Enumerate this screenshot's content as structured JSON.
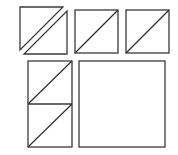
{
  "diagram": {
    "type": "quilt-block-pieces",
    "background": "#ffffff",
    "stroke_color": "#3a3a3a",
    "pieces": [
      {
        "id": "split-square",
        "kind": "two-separated-half-square-triangles",
        "triangles": [
          {
            "points": [
              [
                20,
                7
              ],
              [
                63,
                7
              ],
              [
                20,
                50
              ]
            ]
          },
          {
            "points": [
              [
                67,
                11
              ],
              [
                67,
                54
              ],
              [
                24,
                54
              ]
            ]
          }
        ]
      },
      {
        "id": "hst-square-1",
        "kind": "half-square-triangle",
        "rect": {
          "x": 75,
          "y": 10,
          "w": 43,
          "h": 43
        },
        "diagonal": [
          [
            75,
            53
          ],
          [
            118,
            10
          ]
        ]
      },
      {
        "id": "hst-square-2",
        "kind": "half-square-triangle",
        "rect": {
          "x": 126,
          "y": 10,
          "w": 43,
          "h": 43
        },
        "diagonal": [
          [
            126,
            53
          ],
          [
            169,
            10
          ]
        ]
      },
      {
        "id": "hst-stack",
        "kind": "two-stacked-half-square-triangles",
        "rect": {
          "x": 28,
          "y": 61,
          "w": 44,
          "h": 86
        },
        "divider_y": 104,
        "diagonals": [
          [
            [
              28,
              104
            ],
            [
              72,
              61
            ]
          ],
          [
            [
              28,
              147
            ],
            [
              72,
              104
            ]
          ]
        ]
      },
      {
        "id": "plain-square",
        "kind": "square",
        "rect": {
          "x": 79,
          "y": 61,
          "w": 86,
          "h": 86
        }
      }
    ]
  }
}
